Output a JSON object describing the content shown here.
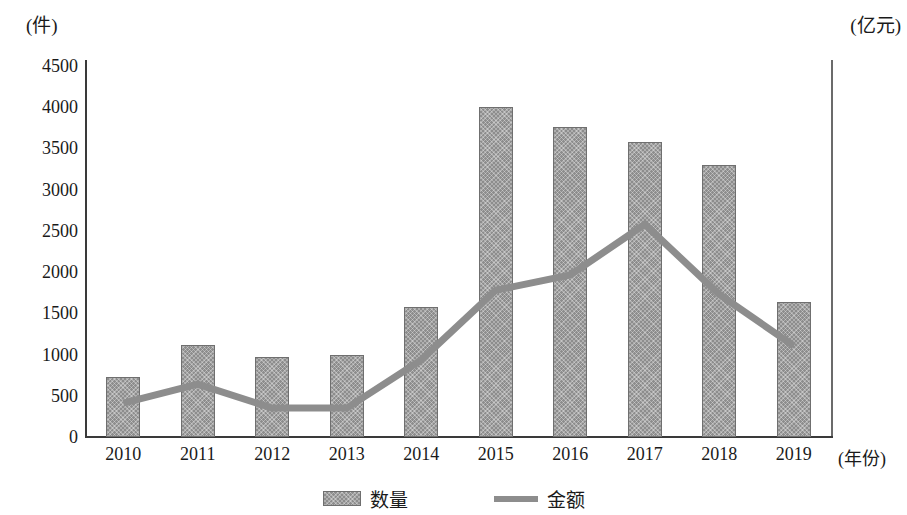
{
  "chart_data": {
    "type": "bar",
    "title": "",
    "xlabel": "(年份)",
    "ylabel": "(件)",
    "ylabel_secondary": "(亿元)",
    "categories": [
      "2010",
      "2011",
      "2012",
      "2013",
      "2014",
      "2015",
      "2016",
      "2017",
      "2018",
      "2019"
    ],
    "ylim": [
      0,
      4500
    ],
    "ylim_secondary": [
      0,
      4500
    ],
    "yticks": [
      "0",
      "500",
      "1000",
      "1500",
      "2000",
      "2500",
      "3000",
      "3500",
      "4000",
      "4500"
    ],
    "ytick_values": [
      0,
      500,
      1000,
      1500,
      2000,
      2500,
      3000,
      3500,
      4000,
      4500
    ],
    "grid": false,
    "legend_position": "bottom",
    "series": [
      {
        "name": "数量",
        "type": "bar",
        "axis": "left",
        "color": "#8d8d8d",
        "values": [
          730,
          1120,
          970,
          995,
          1575,
          4000,
          3760,
          3580,
          3300,
          1640
        ]
      },
      {
        "name": "金额",
        "type": "line",
        "axis": "right",
        "color": "#8d8d8d",
        "values": [
          410,
          640,
          350,
          350,
          935,
          1780,
          1965,
          2580,
          1730,
          1105
        ]
      }
    ]
  },
  "legend": {
    "items": [
      {
        "label": "数量",
        "marker": "bar-swatch"
      },
      {
        "label": "金额",
        "marker": "line-swatch"
      }
    ]
  }
}
